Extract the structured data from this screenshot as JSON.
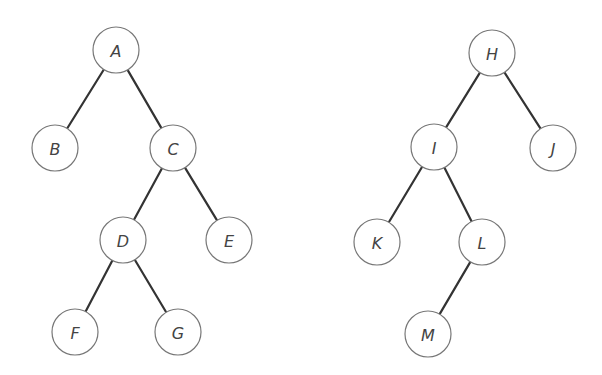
{
  "diagram": {
    "type": "binary-trees",
    "node_radius": 23,
    "colors": {
      "edge": "#333333",
      "node_stroke": "#777777",
      "node_fill": "#ffffff",
      "label": "#444444"
    },
    "trees": [
      {
        "name": "left-tree",
        "root": "A",
        "nodes": [
          {
            "id": "A",
            "label": "A",
            "x": 116,
            "y": 50
          },
          {
            "id": "B",
            "label": "B",
            "x": 55,
            "y": 148
          },
          {
            "id": "C",
            "label": "C",
            "x": 173,
            "y": 148
          },
          {
            "id": "D",
            "label": "D",
            "x": 123,
            "y": 240
          },
          {
            "id": "E",
            "label": "E",
            "x": 229,
            "y": 240
          },
          {
            "id": "F",
            "label": "F",
            "x": 75,
            "y": 332
          },
          {
            "id": "G",
            "label": "G",
            "x": 178,
            "y": 332
          }
        ],
        "edges": [
          [
            "A",
            "B"
          ],
          [
            "A",
            "C"
          ],
          [
            "C",
            "D"
          ],
          [
            "C",
            "E"
          ],
          [
            "D",
            "F"
          ],
          [
            "D",
            "G"
          ]
        ]
      },
      {
        "name": "right-tree",
        "root": "H",
        "nodes": [
          {
            "id": "H",
            "label": "H",
            "x": 492,
            "y": 53
          },
          {
            "id": "I",
            "label": "I",
            "x": 434,
            "y": 147
          },
          {
            "id": "J",
            "label": "J",
            "x": 553,
            "y": 148
          },
          {
            "id": "K",
            "label": "K",
            "x": 377,
            "y": 242
          },
          {
            "id": "L",
            "label": "L",
            "x": 482,
            "y": 242
          },
          {
            "id": "M",
            "label": "M",
            "x": 428,
            "y": 334
          }
        ],
        "edges": [
          [
            "H",
            "I"
          ],
          [
            "H",
            "J"
          ],
          [
            "I",
            "K"
          ],
          [
            "I",
            "L"
          ],
          [
            "L",
            "M"
          ]
        ]
      }
    ]
  }
}
